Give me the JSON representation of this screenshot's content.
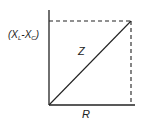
{
  "diagram": {
    "type": "impedance-triangle",
    "labels": {
      "vertical_axis": "(X",
      "vertical_sub1": "L",
      "vertical_minus": "-X",
      "vertical_sub2": "C",
      "vertical_close": ")",
      "hypotenuse": "Z",
      "horizontal_axis": "R"
    },
    "colors": {
      "line": "#222222",
      "background": "#ffffff"
    }
  }
}
